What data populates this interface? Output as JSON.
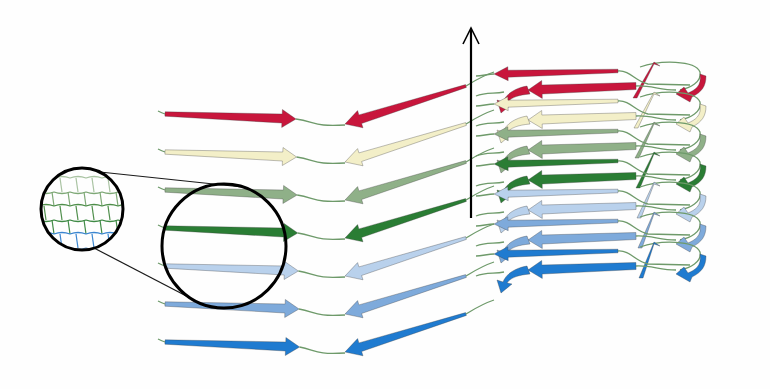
{
  "diagram": {
    "title": "",
    "type": "beta-sheet fibril stacking illustration",
    "loop_color": "#6e9a6a",
    "axis_color": "#000000",
    "magnifier_color": "#000000",
    "strands": [
      {
        "name": "red",
        "fill": "#c8163c",
        "dark": "#a80f30"
      },
      {
        "name": "cream",
        "fill": "#f3efc8",
        "dark": "#cfc99a"
      },
      {
        "name": "sage",
        "fill": "#8fb088",
        "dark": "#6d9066"
      },
      {
        "name": "green",
        "fill": "#2a7d34",
        "dark": "#1f6228"
      },
      {
        "name": "pale-blue",
        "fill": "#b9d1ec",
        "dark": "#8fb0d6"
      },
      {
        "name": "mid-blue",
        "fill": "#7eaadb",
        "dark": "#5a8cc4"
      },
      {
        "name": "blue",
        "fill": "#1f7bd0",
        "dark": "#155fa6"
      }
    ],
    "left_panel": {
      "row_start_y": 114,
      "row_spacing": 38,
      "x_start": 158,
      "x_tail": 165,
      "x_head": 296
    },
    "middle_panel": {
      "x_top": 466,
      "x_head": 345,
      "y_top_offset": -28,
      "y_head_offset": 10
    },
    "axis": {
      "x": 471,
      "y_top": 28,
      "y_bottom": 218
    },
    "magnifier": {
      "small": {
        "cx": 82,
        "cy": 209,
        "r": 41
      },
      "large": {
        "cx": 224,
        "cy": 246,
        "r": 62
      }
    },
    "right_panel": {
      "top_y": 70,
      "row_spacing": 30
    }
  }
}
